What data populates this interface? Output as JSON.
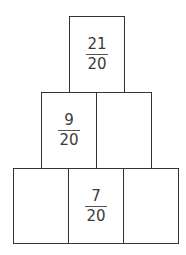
{
  "pyramid": {
    "rows": [
      {
        "cells": [
          {
            "num": "21",
            "den": "20"
          }
        ]
      },
      {
        "cells": [
          {
            "num": "9",
            "den": "20"
          },
          {
            "num": "",
            "den": ""
          }
        ]
      },
      {
        "cells": [
          {
            "num": "",
            "den": ""
          },
          {
            "num": "7",
            "den": "20"
          },
          {
            "num": "",
            "den": ""
          }
        ]
      }
    ]
  }
}
